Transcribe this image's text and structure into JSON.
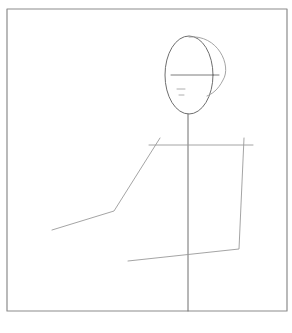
{
  "canvas": {
    "width": 292,
    "height": 333,
    "background": "#ffffff"
  },
  "colors": {
    "frame": "#8c8c8c",
    "line": "#6e6e6e",
    "faint": "#9a9a9a"
  },
  "frame": {
    "x": 7,
    "y": 9,
    "width": 280,
    "height": 302
  },
  "figure": {
    "head": {
      "cx": 189,
      "cy": 75,
      "rx": 24,
      "ry": 39
    },
    "hair_arc": "M 189 37 C 218 34, 232 66, 223 80 C 218 90, 212 94, 207 96",
    "eye_line": {
      "x1": 171,
      "y1": 75,
      "x2": 219,
      "y2": 75
    },
    "nose_marks": [
      {
        "x1": 177,
        "y1": 89,
        "x2": 185,
        "y2": 89
      },
      {
        "x1": 179,
        "y1": 95,
        "x2": 184,
        "y2": 95
      }
    ],
    "spine": {
      "x1": 188,
      "y1": 114,
      "x2": 188,
      "y2": 311
    },
    "shoulders": {
      "x1": 149,
      "y1": 145,
      "x2": 253,
      "y2": 145
    },
    "left_arm": "M 160 138 L 114 211 L 52 230",
    "right_arm": "M 244 138 L 239 249 L 128 261"
  }
}
